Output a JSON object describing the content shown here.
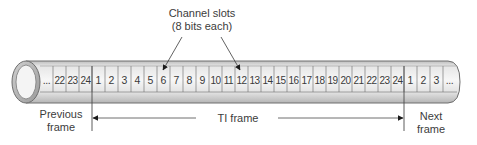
{
  "diagram": {
    "callout": {
      "line1": "Channel slots",
      "line2": "(8 bits each)",
      "targets": [
        "6",
        "12"
      ]
    },
    "pipe": {
      "leading_ellipsis": "...",
      "previous_frame_slots": [
        "22",
        "23",
        "24"
      ],
      "current_frame_slots": [
        "1",
        "2",
        "3",
        "4",
        "5",
        "6",
        "7",
        "8",
        "9",
        "10",
        "11",
        "12",
        "13",
        "14",
        "15",
        "16",
        "17",
        "18",
        "19",
        "20",
        "21",
        "22",
        "23",
        "24"
      ],
      "next_frame_slots": [
        "1",
        "2",
        "3"
      ],
      "trailing_ellipsis": "..."
    },
    "labels": {
      "previous_frame_line1": "Previous",
      "previous_frame_line2": "frame",
      "frame_label": "TI frame",
      "next_frame_line1": "Next",
      "next_frame_line2": "frame"
    },
    "colors": {
      "pipe_fill_light": "#f2f2f2",
      "pipe_fill_dark": "#c8c8c8",
      "pipe_outline": "#6e6e6e",
      "text": "#3c3c3c",
      "arrow": "#1a1a1a"
    }
  }
}
